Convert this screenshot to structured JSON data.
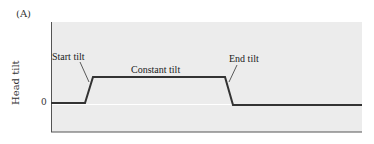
{
  "panel_label": "(A)",
  "y_axis_label": "Head tilt",
  "y_tick_zero": "0",
  "annotations": {
    "start": "Start tilt",
    "constant": "Constant tilt",
    "end": "End tilt"
  },
  "colors": {
    "panel_bg": "#ececec",
    "trace": "#333333",
    "axis": "#555555",
    "zero_line": "#ffffff"
  },
  "trace_profile": {
    "description": "Head tilt over time: baseline 0, ramps up (start tilt), holds (constant tilt), ramps back down (end tilt), returns to 0",
    "segments": [
      "baseline",
      "start-tilt-ramp",
      "constant-tilt",
      "end-tilt-ramp",
      "baseline"
    ]
  }
}
